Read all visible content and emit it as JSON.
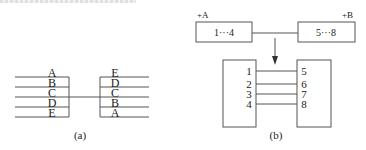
{
  "figure_a": {
    "caption": "(a)",
    "left_stack": [
      "A",
      "B",
      "C",
      "D",
      "E"
    ],
    "right_stack": [
      "E",
      "D",
      "C",
      "B",
      "A"
    ],
    "connected_row": "C"
  },
  "figure_b": {
    "caption": "(b)",
    "top": {
      "left_block": {
        "tag": "+A",
        "label": "1···4"
      },
      "right_block": {
        "tag": "+B",
        "label": "5···8"
      }
    },
    "bottom": {
      "left_terminals": [
        "1",
        "2",
        "3",
        "4"
      ],
      "right_terminals": [
        "5",
        "6",
        "7",
        "8"
      ]
    }
  },
  "colors": {
    "line": "#555555",
    "text": "#222222",
    "background": "#ffffff"
  }
}
